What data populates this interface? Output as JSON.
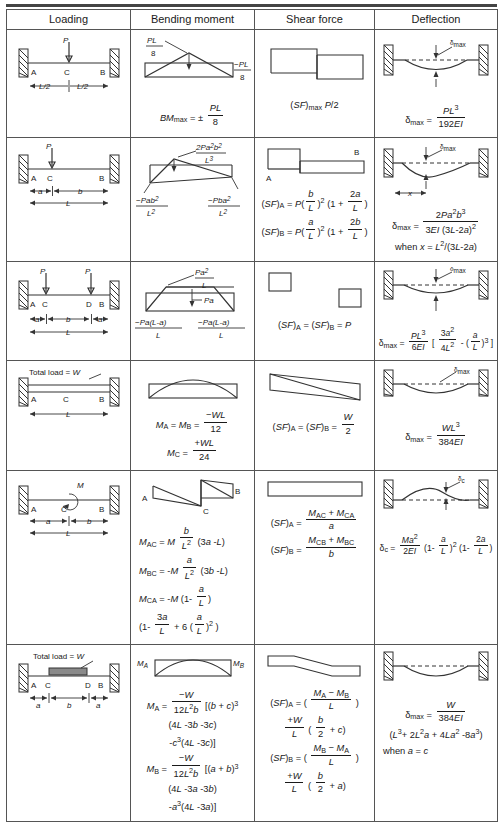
{
  "table": {
    "headers": [
      "Loading",
      "Bending moment",
      "Shear force",
      "Deflection"
    ],
    "rows": [
      {
        "id": "central-point-load-fixed-fixed",
        "loading": {
          "load_label": "P",
          "points": [
            "A",
            "C",
            "B"
          ],
          "dims": [
            "L/2",
            "L/2"
          ]
        },
        "bending_moment": {
          "peak_label_num": "PL",
          "peak_label_den": "8",
          "right_label_num": "−PL",
          "right_label_den": "8",
          "equation": "BM_max = ± PL/8"
        },
        "shear_force": {
          "equation": "(SF)_max P/2"
        },
        "deflection": {
          "marker": "δmax",
          "equation": "δmax = PL³ / 192EI"
        }
      },
      {
        "id": "offset-point-load-fixed-fixed",
        "loading": {
          "load_label": "P",
          "points": [
            "A",
            "C",
            "B"
          ],
          "dims": [
            "a",
            "b",
            "L"
          ]
        },
        "bending_moment": {
          "peak_num": "2Pa²b²",
          "peak_den": "L³",
          "left_num": "−Pab²",
          "left_den": "L²",
          "right_num": "−Pba²",
          "right_den": "L²"
        },
        "shear_force": {
          "diagram_labels": [
            "A",
            "B"
          ],
          "eq1": "(SF)A = P(b/L)² (1 + 2a/L)",
          "eq2": "(SF)B = P(a/L)² (1 + 2b/L)"
        },
        "deflection": {
          "marker": "δmax",
          "dim": "x",
          "equation": "δmax = 2Pa²b³ / 3EI (3L-2a)²",
          "condition": "when x = L²/(3L-2a)"
        }
      },
      {
        "id": "two-symmetric-point-loads-fixed-fixed",
        "loading": {
          "load_label_1": "P",
          "load_label_2": "P",
          "points": [
            "A",
            "C",
            "D",
            "B"
          ],
          "dims": [
            "a",
            "b",
            "a",
            "L"
          ]
        },
        "bending_moment": {
          "peak_num": "Pa²",
          "peak_den": "L",
          "mid_label": "Pa",
          "left_num": "−Pa(L-a)",
          "left_den": "L",
          "right_num": "−Pa(L-a)",
          "right_den": "L"
        },
        "shear_force": {
          "equation": "(SF)A = (SF)B = P"
        },
        "deflection": {
          "marker": "δmax",
          "equation": "δmax = PL³/6EI [ 3a²/4L² - (a/L)³ ]"
        }
      },
      {
        "id": "udl-full-span-fixed-fixed",
        "loading": {
          "total_load": "Total load = W",
          "points": [
            "A",
            "C",
            "B"
          ],
          "dims": [
            "L"
          ]
        },
        "bending_moment": {
          "eq1": "MA = MB = −WL/12",
          "eq2": "MC = +WL/24"
        },
        "shear_force": {
          "equation": "(SF)A = (SF)B = W/2"
        },
        "deflection": {
          "marker": "δmax",
          "equation": "δmax = WL³/384EI"
        }
      },
      {
        "id": "applied-moment-fixed-fixed",
        "loading": {
          "moment_label": "M",
          "points": [
            "A",
            "C",
            "B"
          ],
          "dims": [
            "a",
            "b",
            "L"
          ]
        },
        "bending_moment": {
          "diagram_labels": [
            "A",
            "C",
            "B"
          ],
          "eq1": "MAC = M b/L² (3a -L)",
          "eq2": "MBC = -M a/L² (3b -L)",
          "eq3": "MCA = -M (1- a/L)",
          "eq4": "(1- 3a/L + 6 (a/L)² )"
        },
        "shear_force": {
          "eq1": "(SF)A = (MAC + MCA)/a",
          "eq2": "(SF)B = (MCB + MBC)/b"
        },
        "deflection": {
          "marker": "δc",
          "equation": "δc = Ma²/2EI (1- a/L)² (1- 2a/L)"
        }
      },
      {
        "id": "partial-udl-central-fixed-fixed",
        "loading": {
          "total_load": "Total load = W",
          "points": [
            "A",
            "C",
            "D",
            "B"
          ],
          "dims": [
            "a",
            "b",
            "a"
          ]
        },
        "bending_moment": {
          "end_labels": [
            "MA",
            "MB"
          ],
          "eq1": "MA = −W/12L²b [(b + c)³",
          "eq2": "(4L -3b -3c)",
          "eq3": "-c³(4L -3c)]",
          "eq4": "MB = −W/12L²b [(a + b)³",
          "eq5": "(4L -3a -3b)",
          "eq6": "-a³(4L -3a)]"
        },
        "shear_force": {
          "eq1": "(SF)A = ( (MA − MB)/L )",
          "eq2": "+W/L (b/2 + c)",
          "eq3": "(SF)B = ( (MB − MA)/L )",
          "eq4": "+W/L (b/2 + a)"
        },
        "deflection": {
          "eq1": "δmax = W/384EI",
          "eq2": "(L³+ 2L²a + 4La² -8a³)",
          "eq3": "when a = c"
        }
      }
    ]
  },
  "symbols": {
    "delta_max": "δmax",
    "delta_c": "δc",
    "plus_minus": "±"
  },
  "colors": {
    "rule": "#444444",
    "line": "#333333",
    "load_fill": "#8a8a8a",
    "text": "#1a1a1a"
  }
}
